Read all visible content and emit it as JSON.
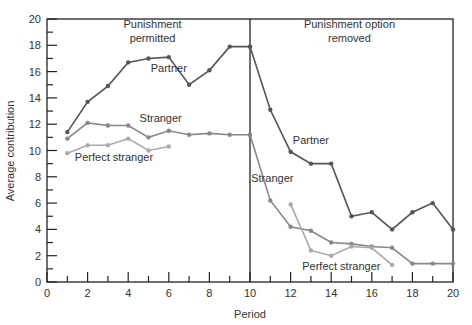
{
  "chart_data": {
    "type": "line",
    "title": "",
    "xlabel": "Period",
    "ylabel": "Average contribution",
    "xlim": [
      0,
      20
    ],
    "ylim": [
      0,
      20
    ],
    "x_ticks": [
      0,
      2,
      4,
      6,
      8,
      10,
      12,
      14,
      16,
      18,
      20
    ],
    "y_ticks": [
      0,
      2,
      4,
      6,
      8,
      10,
      12,
      14,
      16,
      18,
      20
    ],
    "grid": false,
    "divider_x": 10,
    "annotations": [
      {
        "id": "punish-permitted",
        "lines": [
          "Punishment",
          "permitted"
        ],
        "x": 5.2,
        "y": 19.3
      },
      {
        "id": "punish-removed",
        "lines": [
          "Punishment option",
          "removed"
        ],
        "x": 14.9,
        "y": 19.3
      }
    ],
    "series": [
      {
        "name": "Partner",
        "color": "#555555",
        "segments": [
          {
            "x": [
              1,
              2,
              3,
              4,
              5,
              6,
              7,
              8,
              9,
              10
            ],
            "y": [
              11.4,
              13.7,
              14.9,
              16.7,
              17.0,
              17.1,
              15.0,
              16.1,
              17.9,
              17.9
            ]
          },
          {
            "x": [
              10,
              11,
              12,
              13,
              14,
              15,
              16,
              17,
              18,
              19,
              20
            ],
            "y": [
              17.9,
              13.1,
              9.9,
              9.0,
              9.0,
              5.0,
              5.3,
              4.0,
              5.3,
              6.0,
              4.0
            ]
          }
        ],
        "labels": [
          {
            "x": 6.0,
            "y": 16.0
          },
          {
            "x": 13.0,
            "y": 10.5
          }
        ]
      },
      {
        "name": "Stranger",
        "color": "#888888",
        "segments": [
          {
            "x": [
              1,
              2,
              3,
              4,
              5,
              6,
              7,
              8,
              9,
              10
            ],
            "y": [
              10.9,
              12.1,
              11.9,
              11.9,
              11.0,
              11.5,
              11.2,
              11.3,
              11.2,
              11.2
            ]
          },
          {
            "x": [
              10,
              11,
              12,
              13,
              14,
              15,
              16,
              17,
              18,
              19,
              20
            ],
            "y": [
              11.2,
              6.2,
              4.2,
              3.9,
              3.0,
              2.9,
              2.7,
              2.6,
              1.4,
              1.4,
              1.4
            ]
          }
        ],
        "labels": [
          {
            "x": 5.6,
            "y": 12.2
          },
          {
            "x": 11.1,
            "y": 7.6
          }
        ]
      },
      {
        "name": "Perfect stranger",
        "color": "#aaaaaa",
        "segments": [
          {
            "x": [
              1,
              2,
              3,
              4,
              5,
              6
            ],
            "y": [
              9.8,
              10.4,
              10.4,
              10.9,
              10.0,
              10.3
            ]
          },
          {
            "x": [
              12,
              13,
              14,
              15,
              16,
              17
            ],
            "y": [
              5.9,
              2.4,
              2.0,
              2.7,
              2.6,
              1.3
            ]
          }
        ],
        "labels": [
          {
            "x": 3.3,
            "y": 9.2
          },
          {
            "x": 14.5,
            "y": 0.9
          }
        ]
      }
    ]
  }
}
